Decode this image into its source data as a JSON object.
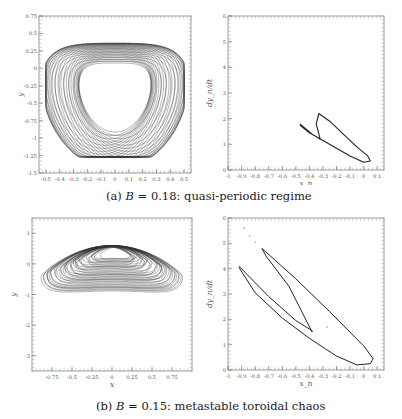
{
  "figure": {
    "captions": {
      "a": {
        "label": "(a)",
        "var": "B",
        "eq": " = 0.18: ",
        "text": "quasi-periodic regime"
      },
      "b": {
        "label": "(b)",
        "var": "B",
        "eq": " = 0.15: ",
        "text": "metastable toroidal chaos"
      }
    }
  },
  "chart_data": [
    {
      "id": "a-left",
      "type": "line",
      "title": "",
      "description": "Phase portrait (x vs y), quasi-periodic heart-shaped torus",
      "xlabel": "x",
      "ylabel": "y",
      "xlim": [
        -0.55,
        0.55
      ],
      "ylim": [
        -1.5,
        0.75
      ],
      "xticks": [
        "-0.5",
        "-0.4",
        "-0.3",
        "-0.2",
        "-0.1",
        "0",
        "0.1",
        "0.2",
        "0.3",
        "0.4",
        "0.5"
      ],
      "yticks": [
        "0.75",
        "0.5",
        "0.25",
        "0",
        "-0.25",
        "-0.5",
        "-0.75",
        "-1",
        "-1.25",
        "-1.5"
      ],
      "grid": false,
      "extent": {
        "x": [
          -0.47,
          0.47
        ],
        "y": [
          -1.25,
          0.62
        ]
      }
    },
    {
      "id": "a-right",
      "type": "line",
      "title": "",
      "description": "Poincare-type map x_n vs dy_n/dt, closed loop",
      "xlabel": "x_n",
      "ylabel": "dy_n/dt",
      "xlim": [
        -1,
        0.15
      ],
      "ylim": [
        0,
        6
      ],
      "xticks": [
        "-1",
        "-0.9",
        "-0.8",
        "-0.7",
        "-0.6",
        "-0.5",
        "-0.4",
        "-0.3",
        "-0.2",
        "-0.1",
        "0",
        "0.1"
      ],
      "yticks": [
        "0",
        "1",
        "2",
        "3",
        "4",
        "5",
        "6"
      ],
      "grid": false,
      "x": [
        -0.47,
        -0.38,
        -0.32,
        -0.35,
        -0.33,
        -0.25,
        -0.15,
        -0.05,
        0.03,
        0.05,
        0.0,
        -0.1,
        -0.2,
        -0.3,
        -0.4,
        -0.47
      ],
      "y": [
        1.8,
        1.4,
        1.2,
        1.8,
        2.2,
        1.9,
        1.4,
        0.9,
        0.55,
        0.35,
        0.3,
        0.55,
        0.85,
        1.15,
        1.45,
        1.75
      ]
    },
    {
      "id": "b-left",
      "type": "line",
      "title": "",
      "description": "Phase portrait (x vs y), metastable toroidal chaos",
      "xlabel": "x",
      "ylabel": "y",
      "xlim": [
        -1.0,
        1.0
      ],
      "ylim": [
        -3.5,
        1.5
      ],
      "xticks": [
        "-0.75",
        "-0.5",
        "-0.25",
        "0",
        "0.25",
        "0.5",
        "0.75"
      ],
      "yticks": [
        "1",
        "0",
        "-1",
        "-2",
        "-3"
      ],
      "grid": false,
      "extent": {
        "x": [
          -0.9,
          0.9
        ],
        "y": [
          -3.1,
          0.7
        ]
      }
    },
    {
      "id": "b-right",
      "type": "line",
      "title": "",
      "description": "Map x_n vs dy_n/dt, elongated loop",
      "xlabel": "x_n",
      "ylabel": "dy_n/dt",
      "xlim": [
        -1,
        0.15
      ],
      "ylim": [
        0,
        6
      ],
      "xticks": [
        "-1",
        "-0.9",
        "-0.8",
        "-0.7",
        "-0.6",
        "-0.5",
        "-0.4",
        "-0.3",
        "-0.2",
        "-0.1",
        "0",
        "0.1"
      ],
      "yticks": [
        "0",
        "1",
        "2",
        "3",
        "4",
        "5",
        "6"
      ],
      "grid": false,
      "x": [
        -0.92,
        -0.7,
        -0.5,
        -0.38,
        -0.38,
        -0.55,
        -0.72,
        -0.75,
        -0.5,
        -0.25,
        0.0,
        0.07,
        0.05,
        -0.05,
        -0.2,
        -0.4,
        -0.6,
        -0.8,
        -0.92
      ],
      "y": [
        4.1,
        2.9,
        1.95,
        1.55,
        1.5,
        3.3,
        4.5,
        4.8,
        3.6,
        2.3,
        0.95,
        0.45,
        0.25,
        0.2,
        0.55,
        1.25,
        2.05,
        3.05,
        4.05
      ]
    }
  ]
}
